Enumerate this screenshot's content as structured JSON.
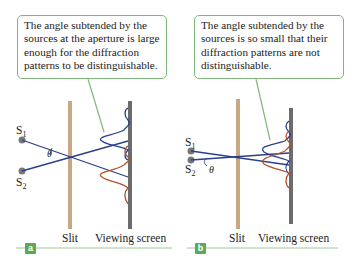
{
  "panels": [
    {
      "id": "a",
      "tag": "a",
      "callout": "The angle subtended by the sources at the aperture is large enough for the diffraction patterns to be distinguishable.",
      "source1": "S1",
      "source2": "S2",
      "angle": "θ",
      "slit_label": "Slit",
      "screen_label": "Viewing screen"
    },
    {
      "id": "b",
      "tag": "b",
      "callout": "The angle subtended by the sources is so small that their diffraction patterns are not distinguishable.",
      "source1": "S1",
      "source2": "S2",
      "angle": "θ",
      "slit_label": "Slit",
      "screen_label": "Viewing screen"
    }
  ],
  "colors": {
    "callout_border": "#7fb77a",
    "ray_blue": "#2b3f8c",
    "pattern_red": "#b5532c",
    "slit": "#c8a882",
    "screen": "#6b6b6b",
    "tag_bg": "#5aa956"
  }
}
